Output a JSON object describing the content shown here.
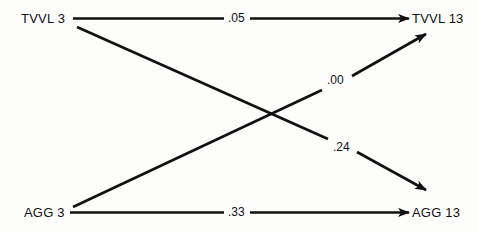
{
  "diagram": {
    "type": "path-diagram",
    "background_color": "#fdfdfc",
    "line_color": "#111111",
    "nodes": [
      {
        "id": "tvvl3",
        "label": "TVVL 3",
        "position": "top-left"
      },
      {
        "id": "tvvl13",
        "label": "TVVL 13",
        "position": "top-right"
      },
      {
        "id": "agg3",
        "label": "AGG 3",
        "position": "bottom-left"
      },
      {
        "id": "agg13",
        "label": "AGG 13",
        "position": "bottom-right"
      }
    ],
    "edges": [
      {
        "id": "tvvl3-tvvl13",
        "from": "tvvl3",
        "to": "tvvl13",
        "coefficient": ".05",
        "kind": "autoregressive-top"
      },
      {
        "id": "tvvl3-agg13",
        "from": "tvvl3",
        "to": "agg13",
        "coefficient": ".24",
        "kind": "cross-lagged-down"
      },
      {
        "id": "agg3-tvvl13",
        "from": "agg3",
        "to": "tvvl13",
        "coefficient": ".00",
        "kind": "cross-lagged-up"
      },
      {
        "id": "agg3-agg13",
        "from": "agg3",
        "to": "agg13",
        "coefficient": ".33",
        "kind": "autoregressive-bottom"
      }
    ]
  }
}
